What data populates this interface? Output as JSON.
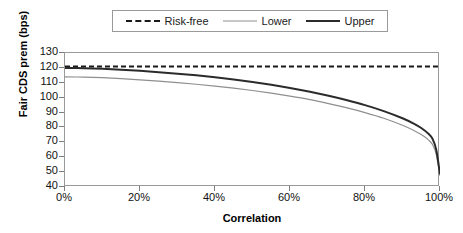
{
  "chart_data": {
    "type": "line",
    "title": "",
    "xlabel": "Correlation",
    "ylabel": "Fair CDS prem (bps)",
    "xlim": [
      0,
      100
    ],
    "ylim": [
      40,
      130
    ],
    "grid": false,
    "legend_position": "top-center",
    "x_tick_labels": [
      "0%",
      "20%",
      "40%",
      "60%",
      "80%",
      "100%"
    ],
    "x_tick_values": [
      0,
      20,
      40,
      60,
      80,
      100
    ],
    "y_tick_labels": [
      "130",
      "120",
      "110",
      "100",
      "90",
      "80",
      "70",
      "60",
      "50",
      "40"
    ],
    "y_tick_values": [
      130,
      120,
      110,
      100,
      90,
      80,
      70,
      60,
      50,
      40
    ],
    "x": [
      0,
      5,
      10,
      15,
      20,
      25,
      30,
      35,
      40,
      45,
      50,
      55,
      60,
      65,
      70,
      75,
      80,
      85,
      90,
      93,
      95,
      97,
      98,
      99,
      100
    ],
    "series": [
      {
        "name": "Risk-free",
        "style": "dashed",
        "color": "#1a1a1a",
        "width": 2,
        "values": [
          121,
          121,
          121,
          121,
          121,
          121,
          121,
          121,
          121,
          121,
          121,
          121,
          121,
          121,
          121,
          121,
          121,
          121,
          121,
          121,
          121,
          121,
          121,
          121,
          121
        ]
      },
      {
        "name": "Lower",
        "style": "solid",
        "color": "#8f8f8f",
        "width": 1.2,
        "values": [
          114.0,
          113.8,
          113.4,
          112.8,
          112.0,
          111.1,
          110.1,
          109.0,
          107.8,
          106.4,
          104.8,
          103.0,
          101.0,
          98.8,
          96.2,
          93.3,
          90.0,
          86.2,
          81.5,
          78.0,
          75.2,
          71.5,
          68.5,
          62.0,
          47.5
        ]
      },
      {
        "name": "Upper",
        "style": "solid",
        "color": "#2b2b2b",
        "width": 2,
        "values": [
          120.0,
          119.8,
          119.4,
          118.8,
          118.0,
          117.1,
          116.1,
          115.0,
          113.7,
          112.2,
          110.5,
          108.6,
          106.5,
          104.1,
          101.4,
          98.4,
          95.0,
          91.0,
          86.2,
          82.6,
          79.6,
          75.6,
          72.4,
          65.0,
          48.5
        ]
      }
    ]
  },
  "legend": {
    "entries": [
      {
        "label": "Risk-free",
        "swatch": "dashed-line-icon"
      },
      {
        "label": "Lower",
        "swatch": "thin-line-icon"
      },
      {
        "label": "Upper",
        "swatch": "thick-line-icon"
      }
    ]
  },
  "axes": {
    "y_title": "Fair CDS prem (bps)",
    "x_title": "Correlation"
  }
}
